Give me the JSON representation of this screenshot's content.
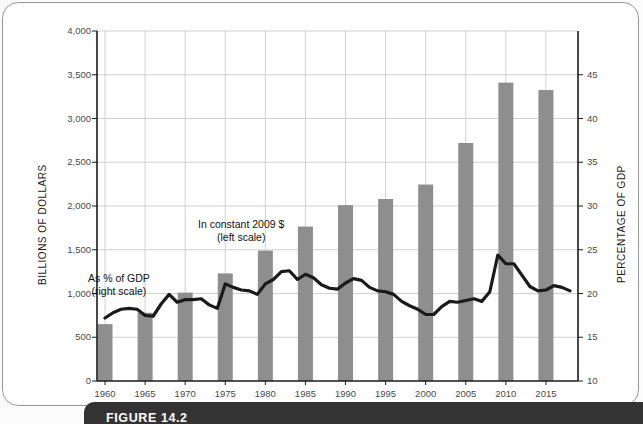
{
  "figure": {
    "caption": "FIGURE 14.2"
  },
  "axes": {
    "left": {
      "title": "BILLIONS OF DOLLARS",
      "ticks": [
        "0",
        "500",
        "1,000",
        "1,500",
        "2,000",
        "2,500",
        "3,000",
        "3,500",
        "4,000"
      ],
      "min": 0,
      "max": 4000,
      "step": 500
    },
    "right": {
      "title": "PERCENTAGE OF GDP",
      "ticks": [
        "10",
        "15",
        "20",
        "25",
        "30",
        "35",
        "40",
        "45"
      ],
      "min": 10,
      "max": 50,
      "step": 5
    },
    "x": {
      "ticks": [
        "1960",
        "1965",
        "1970",
        "1975",
        "1980",
        "1985",
        "1990",
        "1995",
        "2000",
        "2005",
        "2010",
        "2015"
      ]
    }
  },
  "annotations": {
    "bars": {
      "line1": "In constant 2009 $",
      "line2": "(left scale)"
    },
    "line": {
      "line1": "As % of GDP",
      "line2": "(right scale)"
    }
  },
  "colors": {
    "bar": "#8e8e8e",
    "line": "#1a1a1a",
    "grid": "#d0d0d0",
    "axis": "#1b1b1b",
    "caption_bar": "#333333",
    "frame": "#9a9a9a"
  },
  "chart_data": {
    "type": "bar",
    "title": "",
    "xlabel": "",
    "ylabel": "BILLIONS OF DOLLARS",
    "y2label": "PERCENTAGE OF GDP",
    "ylim": [
      0,
      4000
    ],
    "y2lim": [
      10,
      50
    ],
    "grid": true,
    "legend": "annotations",
    "categories": [
      "1960",
      "1965",
      "1970",
      "1975",
      "1980",
      "1985",
      "1990",
      "1995",
      "2000",
      "2005",
      "2010",
      "2015"
    ],
    "series": [
      {
        "name": "In constant 2009 $ (left scale)",
        "type": "bar",
        "axis": "left",
        "unit": "billions of dollars",
        "values": [
          650,
          780,
          1010,
          1230,
          1490,
          1765,
          2010,
          2080,
          2245,
          2720,
          3410,
          3325
        ]
      },
      {
        "name": "As % of GDP (right scale)",
        "type": "line",
        "axis": "right",
        "unit": "percent of GDP",
        "x": [
          1960,
          1961,
          1962,
          1963,
          1964,
          1965,
          1966,
          1967,
          1968,
          1969,
          1970,
          1971,
          1972,
          1973,
          1974,
          1975,
          1976,
          1977,
          1978,
          1979,
          1980,
          1981,
          1982,
          1983,
          1984,
          1985,
          1986,
          1987,
          1988,
          1989,
          1990,
          1991,
          1992,
          1993,
          1994,
          1995,
          1996,
          1997,
          1998,
          1999,
          2000,
          2001,
          2002,
          2003,
          2004,
          2005,
          2006,
          2007,
          2008,
          2009,
          2010,
          2011,
          2012,
          2013,
          2014,
          2015,
          2016,
          2017,
          2018
        ],
        "values": [
          17.2,
          17.8,
          18.2,
          18.3,
          18.2,
          17.5,
          17.4,
          18.8,
          19.9,
          19.0,
          19.3,
          19.3,
          19.4,
          18.7,
          18.3,
          21.1,
          20.7,
          20.4,
          20.3,
          19.9,
          21.1,
          21.6,
          22.5,
          22.6,
          21.6,
          22.2,
          21.8,
          21.0,
          20.6,
          20.5,
          21.2,
          21.7,
          21.5,
          20.7,
          20.3,
          20.2,
          19.9,
          19.1,
          18.6,
          18.2,
          17.6,
          17.6,
          18.5,
          19.1,
          19.0,
          19.2,
          19.4,
          19.1,
          20.2,
          24.4,
          23.4,
          23.4,
          22.1,
          20.8,
          20.3,
          20.4,
          20.9,
          20.7,
          20.3
        ]
      }
    ]
  }
}
